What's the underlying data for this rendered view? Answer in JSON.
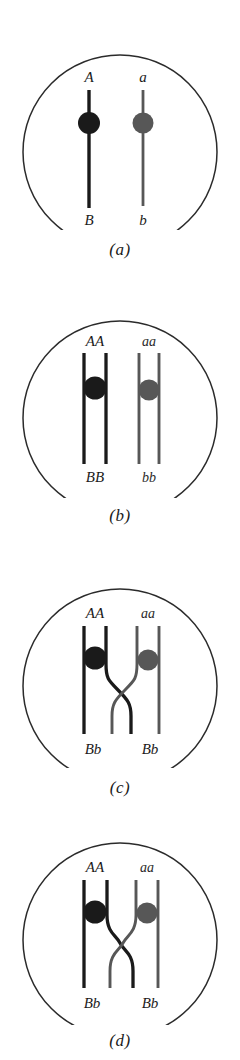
{
  "figure": {
    "circle_outline_color": "#2b2b2b",
    "background": "#ffffff"
  },
  "strands": {
    "dark_color": "#1a1a1a",
    "gray_color": "#575757",
    "dark_name": "maternal-chromosome",
    "gray_name": "paternal-chromosome"
  },
  "panels": [
    {
      "id": "a",
      "caption": "(a)",
      "stage": "unreplicated-homologous-chromosomes",
      "chromosomes": [
        {
          "color": "dark",
          "top_label": "A",
          "bottom_label": "B"
        },
        {
          "color": "gray",
          "top_label": "a",
          "bottom_label": "b"
        }
      ]
    },
    {
      "id": "b",
      "caption": "(b)",
      "stage": "replicated-sister-chromatids",
      "chromosomes": [
        {
          "color": "dark",
          "top_label": "AA",
          "bottom_label": "BB"
        },
        {
          "color": "gray",
          "top_label": "aa",
          "bottom_label": "bb"
        }
      ]
    },
    {
      "id": "c",
      "caption": "(c)",
      "stage": "crossing-over-chiasma",
      "chromosomes": [
        {
          "color": "dark",
          "top_label": "AA",
          "bottom_label": "Bb"
        },
        {
          "color": "gray",
          "top_label": "aa",
          "bottom_label": "Bb"
        }
      ]
    },
    {
      "id": "d",
      "caption": "(d)",
      "stage": "recombination-complete",
      "chromosomes": [
        {
          "color": "dark",
          "top_label": "AA",
          "bottom_label": "Bb"
        },
        {
          "color": "gray",
          "top_label": "aa",
          "bottom_label": "Bb"
        }
      ]
    }
  ]
}
